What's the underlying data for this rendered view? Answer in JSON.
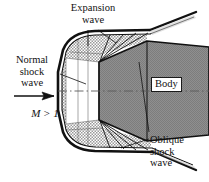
{
  "figure": {
    "background_color": "#ffffff",
    "line_color": "#1a1a1a",
    "body_fill": "#8a8a8a",
    "shock_layer_fill": "#d8d8d8"
  },
  "labels": {
    "expansion_wave": "Expansion\nwave",
    "expansion_wave_line1": "Expansion",
    "expansion_wave_line2": "wave",
    "normal_shock_line1": "Normal",
    "normal_shock_line2": "shock",
    "normal_shock_line3": "wave",
    "mach_number": "M > 1",
    "body": "Body",
    "oblique_shock_line1": "Oblique",
    "oblique_shock_line2": "shock",
    "oblique_shock_line3": "wave"
  },
  "elements": {
    "freestream_arrow": "flow-direction-arrow",
    "centerline": "axis-centerline",
    "bow_shock": "bow-shock-curve",
    "shock_layer": "hatched-shock-layer",
    "body_shape": "gray-body-trapezoid",
    "expansion_fan": "expansion-fan-rays",
    "oblique_shock": "oblique-shock-lines"
  }
}
